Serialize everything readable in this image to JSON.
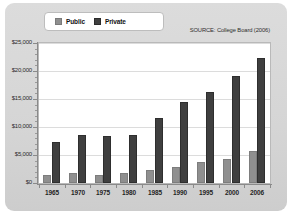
{
  "legend": {
    "position": "top-left",
    "entries": [
      {
        "label": "Public",
        "color": "#8f8f8f",
        "swatch": "public-swatch"
      },
      {
        "label": "Private",
        "color": "#3f3f3f",
        "swatch": "private-swatch"
      }
    ]
  },
  "source_note": "SOURCE: College Board (2006)",
  "chart_data": {
    "type": "bar",
    "title": "",
    "subtitle": "",
    "xlabel": "",
    "ylabel": "",
    "categories": [
      "1965",
      "1970",
      "1975",
      "1980",
      "1985",
      "1990",
      "1995",
      "2000",
      "2006"
    ],
    "series": [
      {
        "name": "Public",
        "color": "#8f8f8f",
        "values": [
          1500,
          1800,
          1500,
          1800,
          2300,
          2800,
          3700,
          4200,
          5800
        ]
      },
      {
        "name": "Private",
        "color": "#3f3f3f",
        "values": [
          7400,
          8600,
          8400,
          8600,
          11600,
          14400,
          16300,
          19100,
          22300
        ]
      }
    ],
    "ylim": [
      0,
      25000
    ],
    "ytick_values": [
      0,
      5000,
      10000,
      15000,
      20000,
      25000
    ],
    "ytick_labels": [
      "$0",
      "$5,000",
      "$10,000",
      "$15,000",
      "$20,000",
      "$25,000"
    ],
    "grid": true,
    "grid_axis": "y",
    "legend_position": "top-left",
    "annotations": [
      "SOURCE: College Board (2006)"
    ]
  }
}
